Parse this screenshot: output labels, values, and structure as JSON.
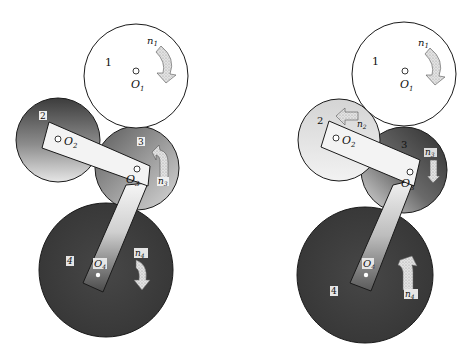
{
  "figure": {
    "left": {
      "gears": [
        {
          "id": "1",
          "label": "1",
          "center_label": "O",
          "center_sub": "1",
          "speed_label": "n",
          "speed_sub": "1",
          "direction": "clockwise"
        },
        {
          "id": "2",
          "label": "2",
          "center_label": "O",
          "center_sub": "2"
        },
        {
          "id": "3",
          "label": "3",
          "center_label": "O",
          "center_sub": "3",
          "speed_label": "n",
          "speed_sub": "3",
          "direction": "counterclockwise"
        },
        {
          "id": "4",
          "label": "4",
          "center_label": "O",
          "center_sub": "4",
          "speed_label": "n",
          "speed_sub": "4",
          "direction": "clockwise"
        }
      ]
    },
    "right": {
      "gears": [
        {
          "id": "1",
          "label": "1",
          "center_label": "O",
          "center_sub": "1",
          "speed_label": "n",
          "speed_sub": "1",
          "direction": "clockwise"
        },
        {
          "id": "2",
          "label": "2",
          "center_label": "O",
          "center_sub": "2",
          "speed_label": "n",
          "speed_sub": "2",
          "direction": "counterclockwise"
        },
        {
          "id": "3",
          "label": "3",
          "center_label": "O",
          "center_sub": "3",
          "speed_label": "n",
          "speed_sub": "3",
          "direction": "clockwise"
        },
        {
          "id": "4",
          "label": "4",
          "center_label": "O",
          "center_sub": "4",
          "speed_label": "n",
          "speed_sub": "4",
          "direction": "counterclockwise"
        }
      ]
    }
  },
  "colors": {
    "gear1_fill": "#ffffff",
    "gear_dark": "#3a3a3a",
    "gear_mid": "#8a8a8a",
    "gear_light": "#e8e8e8",
    "arm_light": "#f4f4f4",
    "arrow_fill": "#d8d8d8",
    "stroke": "#222222"
  }
}
